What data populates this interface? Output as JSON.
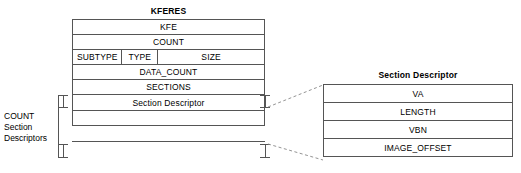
{
  "diagram": {
    "main_struct": {
      "name": "kferes",
      "title": "KFERES",
      "rows": [
        {
          "name": "kfe",
          "label": "KFE",
          "cells": null
        },
        {
          "name": "count",
          "label": "COUNT",
          "cells": null
        },
        {
          "name": "subtype-type-size",
          "label": null,
          "cells": [
            {
              "name": "subtype",
              "label": "SUBTYPE"
            },
            {
              "name": "type",
              "label": "TYPE"
            },
            {
              "name": "size",
              "label": "SIZE"
            }
          ]
        },
        {
          "name": "data-count",
          "label": "DATA_COUNT",
          "cells": null
        },
        {
          "name": "sections",
          "label": "SECTIONS",
          "cells": null
        },
        {
          "name": "section-descriptor",
          "label": "Section Descriptor",
          "cells": null
        },
        {
          "name": "section-descriptor-continued",
          "label": "",
          "cells": null
        }
      ]
    },
    "brace_label": {
      "name": "count-section-descriptors-label",
      "line1": "COUNT",
      "line2": "Section",
      "line3": "Descriptors"
    },
    "detail_struct": {
      "name": "section-descriptor-detail",
      "title": "Section Descriptor",
      "rows": [
        {
          "name": "va",
          "label": "VA"
        },
        {
          "name": "length",
          "label": "LENGTH"
        },
        {
          "name": "vbn",
          "label": "VBN"
        },
        {
          "name": "image-offset",
          "label": "IMAGE_OFFSET"
        }
      ]
    },
    "colors": {
      "line": "#555555",
      "line_strong": "#1a1a1a",
      "text": "#000000",
      "background": "#ffffff",
      "connector": "#777777"
    }
  }
}
